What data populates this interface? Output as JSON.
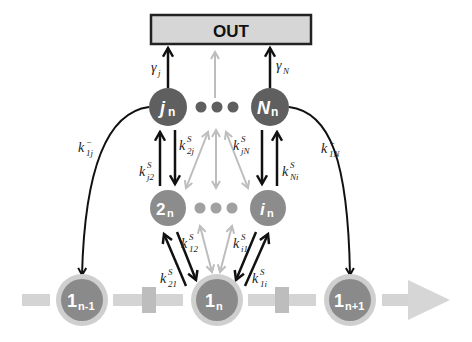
{
  "diagram": {
    "type": "state-transition network",
    "output_box": {
      "label": "OUT",
      "fill": "#d6d6d6",
      "stroke": "#222222"
    },
    "colors": {
      "node_dark": "#5f5f5f",
      "node_mid": "#8c8c8c",
      "node_bottom": "#8a8a8a",
      "node_ring": "#cfcfcf",
      "arrow_black": "#111111",
      "arrow_gray": "#bdbdbd",
      "track": "#d4d4d4"
    },
    "nodes": {
      "j": {
        "main": "j",
        "sub": "n"
      },
      "N": {
        "main": "N",
        "sub": "n"
      },
      "two": {
        "main": "2",
        "sub": "n"
      },
      "i": {
        "main": "i",
        "sub": "n"
      },
      "prev": {
        "main": "1",
        "sub": "n-1"
      },
      "cur": {
        "main": "1",
        "sub": "n"
      },
      "next": {
        "main": "1",
        "sub": "n+1"
      }
    },
    "rates": {
      "gamma_j": {
        "base": "γ",
        "sub": "j",
        "sup": ""
      },
      "gamma_N": {
        "base": "γ",
        "sub": "N",
        "sup": ""
      },
      "k_minus_1j": {
        "base": "k",
        "sub": "1j",
        "sup": "−"
      },
      "k_plus_1N": {
        "base": "k",
        "sub": "1N",
        "sup": "+"
      },
      "k_j2": {
        "base": "k",
        "sub": "j2",
        "sup": "S"
      },
      "k_2j": {
        "base": "k",
        "sub": "2j",
        "sup": "S"
      },
      "k_jN": {
        "base": "k",
        "sub": "jN",
        "sup": "S"
      },
      "k_Ni": {
        "base": "k",
        "sub": "Ni",
        "sup": "S"
      },
      "k_12": {
        "base": "k",
        "sub": "12",
        "sup": "S"
      },
      "k_21": {
        "base": "k",
        "sub": "21",
        "sup": "S"
      },
      "k_i1": {
        "base": "k",
        "sub": "i1",
        "sup": "S"
      },
      "k_1i": {
        "base": "k",
        "sub": "1i",
        "sup": "S"
      }
    },
    "ellipsis_dots": {
      "top_row": 3,
      "middle_row": 3
    }
  }
}
